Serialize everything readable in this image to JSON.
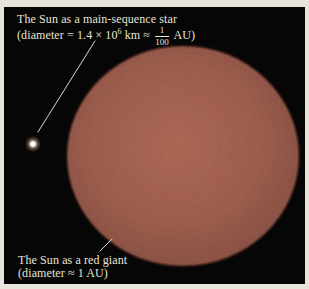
{
  "figure": {
    "top_label": {
      "line1": "The Sun as a main-sequence star",
      "line2_open": "(diameter = 1.4 × 10",
      "exponent": "6",
      "line2_mid": " km ≈ ",
      "fraction_numerator": "1",
      "fraction_denominator": "100",
      "line2_close": " AU)"
    },
    "bottom_label": {
      "line1": "The Sun as a red giant",
      "line2": "(diameter ≈ 1 AU)"
    },
    "colors": {
      "paper": "#e7e4db",
      "panel_background": "#060606",
      "disc_center": "#aa604d",
      "disc_mid": "#9c5645",
      "disc_edge": "#7f4638",
      "label_text": "#e9e4d2",
      "leader_line": "#ded9c6",
      "sun_dot": "#ffffff"
    }
  }
}
